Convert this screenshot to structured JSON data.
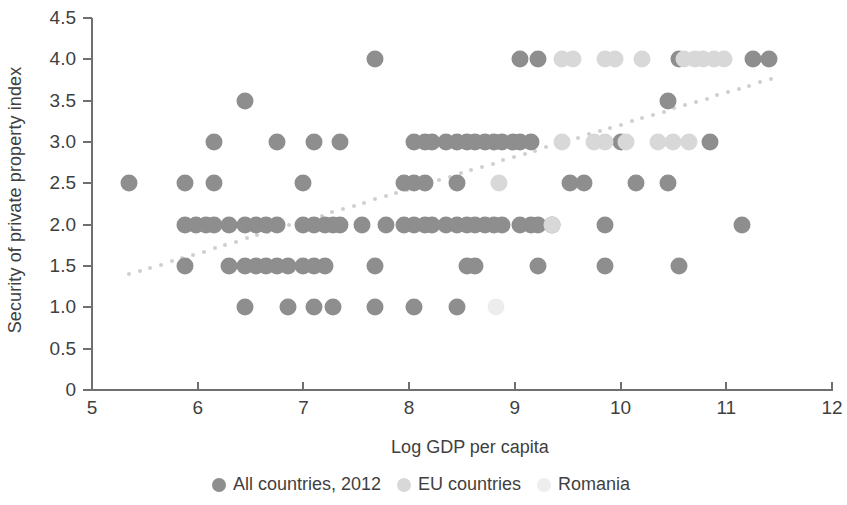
{
  "chart_data": {
    "type": "scatter",
    "title": "",
    "xlabel": "Log GDP per capita",
    "ylabel": "Security of private property index",
    "xlim": [
      5,
      12
    ],
    "ylim": [
      0,
      4.5
    ],
    "xticks": [
      "5",
      "6",
      "7",
      "8",
      "9",
      "10",
      "11",
      "12"
    ],
    "xtick_values": [
      5,
      6,
      7,
      8,
      9,
      10,
      11,
      12
    ],
    "yticks": [
      "0",
      "0.5",
      "1.0",
      "1.5",
      "2.0",
      "2.5",
      "3.0",
      "3.5",
      "4.0",
      "4.5"
    ],
    "ytick_values": [
      0,
      0.5,
      1.0,
      1.5,
      2.0,
      2.5,
      3.0,
      3.5,
      4.0,
      4.5
    ],
    "grid": false,
    "legend_position": "bottom",
    "colors": {
      "all_countries": "#8e8e8e",
      "eu_countries": "#d8d8d8",
      "romania": "#ededed",
      "trendline": "#cfcfcf",
      "axis": "#6f6f6f",
      "text": "#3f3f3f",
      "background": "#ffffff"
    },
    "series": [
      {
        "name": "All countries, 2012",
        "marker": "filled-circle",
        "color": "#8e8e8e",
        "points": [
          [
            5.35,
            2.5
          ],
          [
            5.88,
            2.5
          ],
          [
            5.88,
            2.0
          ],
          [
            5.88,
            1.5
          ],
          [
            5.98,
            2.0
          ],
          [
            6.08,
            2.0
          ],
          [
            6.15,
            3.0
          ],
          [
            6.15,
            2.5
          ],
          [
            6.15,
            2.0
          ],
          [
            6.3,
            2.0
          ],
          [
            6.3,
            1.5
          ],
          [
            6.45,
            3.5
          ],
          [
            6.45,
            2.0
          ],
          [
            6.45,
            1.5
          ],
          [
            6.45,
            1.0
          ],
          [
            6.55,
            2.0
          ],
          [
            6.55,
            1.5
          ],
          [
            6.65,
            2.0
          ],
          [
            6.65,
            1.5
          ],
          [
            6.75,
            3.0
          ],
          [
            6.75,
            2.0
          ],
          [
            6.75,
            1.5
          ],
          [
            6.85,
            1.5
          ],
          [
            6.85,
            1.0
          ],
          [
            7.0,
            2.5
          ],
          [
            7.0,
            2.0
          ],
          [
            7.0,
            1.5
          ],
          [
            7.1,
            3.0
          ],
          [
            7.1,
            2.0
          ],
          [
            7.1,
            1.5
          ],
          [
            7.1,
            1.0
          ],
          [
            7.2,
            2.0
          ],
          [
            7.2,
            1.5
          ],
          [
            7.28,
            2.0
          ],
          [
            7.28,
            1.0
          ],
          [
            7.35,
            3.0
          ],
          [
            7.35,
            2.0
          ],
          [
            7.55,
            2.0
          ],
          [
            7.68,
            4.0
          ],
          [
            7.68,
            1.5
          ],
          [
            7.68,
            1.0
          ],
          [
            7.78,
            2.0
          ],
          [
            7.95,
            2.5
          ],
          [
            7.95,
            2.0
          ],
          [
            8.05,
            3.0
          ],
          [
            8.05,
            2.5
          ],
          [
            8.05,
            2.0
          ],
          [
            8.05,
            1.0
          ],
          [
            8.15,
            3.0
          ],
          [
            8.15,
            2.5
          ],
          [
            8.15,
            2.0
          ],
          [
            8.22,
            3.0
          ],
          [
            8.22,
            2.0
          ],
          [
            8.35,
            3.0
          ],
          [
            8.35,
            2.0
          ],
          [
            8.45,
            3.0
          ],
          [
            8.45,
            2.5
          ],
          [
            8.45,
            2.0
          ],
          [
            8.45,
            1.0
          ],
          [
            8.55,
            3.0
          ],
          [
            8.55,
            2.0
          ],
          [
            8.55,
            1.5
          ],
          [
            8.62,
            3.0
          ],
          [
            8.62,
            2.0
          ],
          [
            8.62,
            1.5
          ],
          [
            8.72,
            3.0
          ],
          [
            8.72,
            2.0
          ],
          [
            8.8,
            3.0
          ],
          [
            8.8,
            2.0
          ],
          [
            8.88,
            3.0
          ],
          [
            8.88,
            2.0
          ],
          [
            8.98,
            3.0
          ],
          [
            9.05,
            4.0
          ],
          [
            9.05,
            3.0
          ],
          [
            9.05,
            2.0
          ],
          [
            9.15,
            3.0
          ],
          [
            9.15,
            2.0
          ],
          [
            9.22,
            4.0
          ],
          [
            9.22,
            2.0
          ],
          [
            9.22,
            1.5
          ],
          [
            9.35,
            2.0
          ],
          [
            9.52,
            2.5
          ],
          [
            9.65,
            2.5
          ],
          [
            9.85,
            2.0
          ],
          [
            9.85,
            1.5
          ],
          [
            10.0,
            3.0
          ],
          [
            10.15,
            2.5
          ],
          [
            10.45,
            3.5
          ],
          [
            10.45,
            2.5
          ],
          [
            10.55,
            4.0
          ],
          [
            10.55,
            1.5
          ],
          [
            10.85,
            3.0
          ],
          [
            11.15,
            2.0
          ],
          [
            11.25,
            4.0
          ],
          [
            11.4,
            4.0
          ]
        ]
      },
      {
        "name": "EU countries",
        "marker": "filled-circle",
        "color": "#d8d8d8",
        "points": [
          [
            9.45,
            4.0
          ],
          [
            9.55,
            4.0
          ],
          [
            9.85,
            4.0
          ],
          [
            9.95,
            4.0
          ],
          [
            10.2,
            4.0
          ],
          [
            10.6,
            4.0
          ],
          [
            10.7,
            4.0
          ],
          [
            10.78,
            4.0
          ],
          [
            10.88,
            4.0
          ],
          [
            10.98,
            4.0
          ],
          [
            9.45,
            3.0
          ],
          [
            9.75,
            3.0
          ],
          [
            9.85,
            3.0
          ],
          [
            10.05,
            3.0
          ],
          [
            10.35,
            3.0
          ],
          [
            10.5,
            3.0
          ],
          [
            10.65,
            3.0
          ],
          [
            8.85,
            2.5
          ],
          [
            9.35,
            2.0
          ]
        ]
      },
      {
        "name": "Romania",
        "marker": "filled-circle",
        "color": "#ededed",
        "points": [
          [
            8.82,
            1.0
          ]
        ]
      }
    ],
    "trendline": {
      "name": "fitted trend",
      "style": "dotted",
      "color": "#cfcfcf",
      "x_start": 5.35,
      "y_start": 1.4,
      "x_end": 11.42,
      "y_end": 3.76
    }
  },
  "legend": {
    "entries": [
      {
        "label": "All countries, 2012",
        "color": "#8e8e8e"
      },
      {
        "label": "EU countries",
        "color": "#d8d8d8"
      },
      {
        "label": "Romania",
        "color": "#ededed"
      }
    ]
  }
}
